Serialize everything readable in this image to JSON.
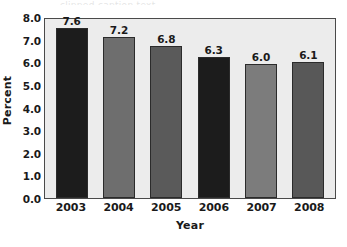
{
  "chart_data": {
    "type": "bar",
    "title": "",
    "subtitle": "",
    "xlabel": "Year",
    "ylabel": "Percent",
    "categories": [
      "2003",
      "2004",
      "2005",
      "2006",
      "2007",
      "2008"
    ],
    "values": [
      7.6,
      7.2,
      6.8,
      6.3,
      6.0,
      6.1
    ],
    "value_labels": [
      "7.6",
      "7.2",
      "6.8",
      "6.3",
      "6.0",
      "6.1"
    ],
    "bar_colors": [
      "#1c1c1c",
      "#6e6e6e",
      "#5a5a5a",
      "#1c1c1c",
      "#7c7c7c",
      "#585858"
    ],
    "ylim": [
      0.0,
      8.0
    ],
    "ytick_values": [
      8.0,
      7.0,
      6.0,
      5.0,
      4.0,
      3.0,
      2.0,
      1.0,
      0.0
    ],
    "ytick_labels": [
      "8.0",
      "7.0",
      "6.0",
      "5.0",
      "4.0",
      "3.0",
      "2.0",
      "1.0",
      "0.0"
    ],
    "grid": false,
    "legend": "none",
    "plot_background": "#ececec",
    "axis_color": "#4a4a4a",
    "bar_edge_color": "#2b2b2b",
    "figure_background": "#ffffff"
  },
  "artifact": {
    "top_sliver_text": "clipped caption text"
  }
}
